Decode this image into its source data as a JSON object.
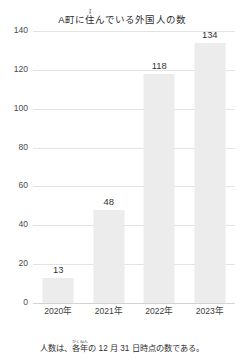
{
  "chart_data": {
    "type": "bar",
    "title_parts": {
      "before": "A町に",
      "ruby_base": "住",
      "ruby_text": "す",
      "after": "んでいる外国人の数"
    },
    "categories": [
      "2020年",
      "2021年",
      "2022年",
      "2023年"
    ],
    "values": [
      13,
      48,
      118,
      134
    ],
    "value_labels": [
      "13",
      "48",
      "118",
      "134"
    ],
    "xlabel": "",
    "ylabel": "",
    "ylim": [
      0,
      140
    ],
    "yticks": [
      0,
      20,
      40,
      60,
      80,
      100,
      120,
      140
    ],
    "ytick_labels": [
      "0",
      "20",
      "40",
      "60",
      "80",
      "100",
      "120",
      "140"
    ],
    "grid": true,
    "grid_axis": "y",
    "legend": false,
    "bar_color": "#ececec",
    "grid_color": "#e3e3e3",
    "text_color": "#333333",
    "background": "#ffffff",
    "caption": "人数は、各年の 12 月 31 日時点の数である。",
    "caption_parts": {
      "before": "人数は、",
      "ruby_base": "各年",
      "ruby_text": "かくねん",
      "after": "の 12 月 31 日時点の数である。"
    }
  }
}
